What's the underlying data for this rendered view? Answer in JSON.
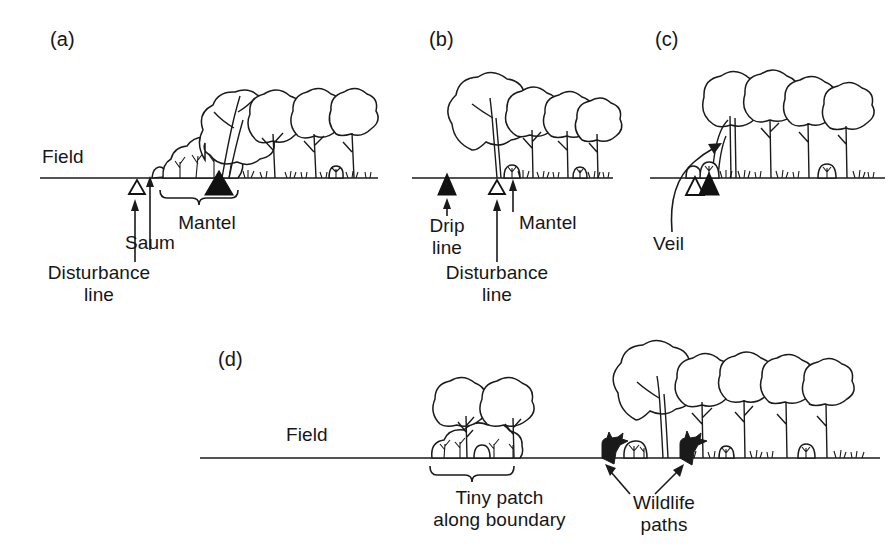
{
  "figure": {
    "type": "scientific-line-drawing",
    "background_color": "#ffffff",
    "ink_color": "#1a1a1a"
  },
  "panels": [
    {
      "id": "a",
      "letter": "(a)",
      "caption_side_label": "Field",
      "description": "Gradual, well-developed edge with shrubby mantel and herbaceous saum",
      "annotations": [
        {
          "id": "a-mantel",
          "label": "Mantel",
          "marker": "brace"
        },
        {
          "id": "a-saum",
          "label": "Saum",
          "marker": "arrow"
        },
        {
          "id": "a-disturbance",
          "label": "Disturbance\nline",
          "marker": "open-triangle"
        }
      ],
      "markers": [
        {
          "type": "open-triangle",
          "meaning": "disturbance line"
        },
        {
          "type": "filled-triangle",
          "meaning": "drip line"
        }
      ]
    },
    {
      "id": "b",
      "letter": "(b)",
      "caption_side_label": "",
      "description": "Abrupt edge; drip line falls outside the disturbance line",
      "annotations": [
        {
          "id": "b-drip",
          "label": "Drip\nline",
          "marker": "filled-triangle"
        },
        {
          "id": "b-disturbance",
          "label": "Disturbance\nline",
          "marker": "open-triangle"
        },
        {
          "id": "b-mantel",
          "label": "Mantel",
          "marker": "arrow"
        }
      ],
      "markers": [
        {
          "type": "filled-triangle",
          "meaning": "drip line"
        },
        {
          "type": "open-triangle",
          "meaning": "disturbance line"
        }
      ]
    },
    {
      "id": "c",
      "letter": "(c)",
      "caption_side_label": "",
      "description": "Edge with a veil of vegetation hanging over the boundary",
      "annotations": [
        {
          "id": "c-veil",
          "label": "Veil",
          "marker": "curved-arrow"
        }
      ],
      "markers": [
        {
          "type": "open-triangle",
          "meaning": "disturbance line"
        },
        {
          "type": "filled-triangle",
          "meaning": "drip line"
        }
      ]
    },
    {
      "id": "d",
      "letter": "(d)",
      "caption_side_label": "Field",
      "description": "Tiny patch along a boundary, and wildlife paths entering the woodland edge",
      "annotations": [
        {
          "id": "d-tiny-patch",
          "label": "Tiny patch\nalong boundary",
          "marker": "brace"
        },
        {
          "id": "d-wildlife",
          "label": "Wildlife\npaths",
          "marker": "double-arrow"
        }
      ],
      "markers": []
    }
  ],
  "labels": {
    "panel_a_letter": "(a)",
    "panel_b_letter": "(b)",
    "panel_c_letter": "(c)",
    "panel_d_letter": "(d)",
    "field_top": "Field",
    "field_bottom": "Field",
    "mantel_a": "Mantel",
    "saum_a": "Saum",
    "disturbance_a_line1": "Disturbance",
    "disturbance_a_line2": "line",
    "drip_b_line1": "Drip",
    "drip_b_line2": "line",
    "mantel_b": "Mantel",
    "disturbance_b_line1": "Disturbance",
    "disturbance_b_line2": "line",
    "veil_c": "Veil",
    "tiny_patch_line1": "Tiny patch",
    "tiny_patch_line2": "along boundary",
    "wildlife_line1": "Wildlife",
    "wildlife_line2": "paths"
  },
  "legend_symbols": [
    {
      "name": "open-triangle",
      "meaning": "Disturbance line",
      "fill": "#ffffff",
      "stroke": "#111111"
    },
    {
      "name": "filled-triangle",
      "meaning": "Drip line",
      "fill": "#111111",
      "stroke": "#111111"
    }
  ]
}
